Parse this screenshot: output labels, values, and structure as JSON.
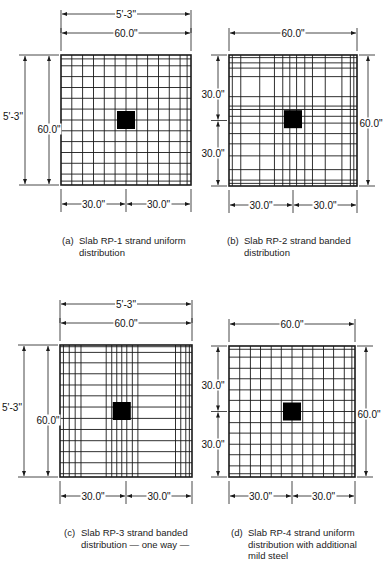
{
  "figure": {
    "panels": [
      {
        "id": "a",
        "caption_tag": "(a)",
        "caption": "Slab RP-1 strand uniform\ndistribution",
        "grid": {
          "x": 61,
          "y": 55,
          "w": 130,
          "h": 130
        },
        "verticals": [
          0.083,
          0.166,
          0.25,
          0.333,
          0.416,
          0.5,
          0.583,
          0.666,
          0.75,
          0.833,
          0.916,
          0.97
        ],
        "horizontals": [
          0.03,
          0.083,
          0.166,
          0.25,
          0.333,
          0.416,
          0.5,
          0.583,
          0.666,
          0.75,
          0.833,
          0.916,
          0.97
        ],
        "column": {
          "cx": 0.5,
          "cy": 0.5,
          "size": 18
        },
        "dims": {
          "top_outer": "5'-3\"",
          "top_inner": "60.0\"",
          "left_outer": "5'-3\"",
          "left_inner": "60.0\"",
          "bottom_left": "30.0\"",
          "bottom_right": "30.0\""
        }
      },
      {
        "id": "b",
        "caption_tag": "(b)",
        "caption": "Slab RP-2 strand banded\ndistribution",
        "grid": {
          "x": 229,
          "y": 55,
          "w": 128,
          "h": 131
        },
        "verticals": [
          0.026,
          0.092,
          0.24,
          0.355,
          0.42,
          0.475,
          0.528,
          0.592,
          0.652,
          0.752,
          0.882,
          0.948,
          0.975
        ],
        "horizontals": [
          0.02,
          0.06,
          0.1,
          0.165,
          0.318,
          0.39,
          0.416,
          0.468,
          0.52,
          0.6,
          0.678,
          0.77,
          0.875,
          0.955,
          0.98
        ],
        "column": {
          "cx": 0.5,
          "cy": 0.49,
          "size": 18
        },
        "dims": {
          "top_inner": "60.0\"",
          "left_top": "30.0\"",
          "left_bottom": "30.0\"",
          "right": "60.0\"",
          "bottom_left": "30.0\"",
          "bottom_right": "30.0\""
        }
      },
      {
        "id": "c",
        "caption_tag": "(c)",
        "caption": "Slab RP-3 strand banded\ndistribution — one way —",
        "grid": {
          "x": 60,
          "y": 345,
          "w": 132,
          "h": 132
        },
        "verticals": [
          0.026,
          0.07,
          0.115,
          0.159,
          0.35,
          0.392,
          0.43,
          0.468,
          0.506,
          0.548,
          0.59,
          0.875,
          0.915,
          0.953,
          0.98
        ],
        "horizontals": [
          0.013,
          0.056,
          0.135,
          0.218,
          0.303,
          0.385,
          0.47,
          0.556,
          0.64,
          0.725,
          0.808,
          0.892,
          0.975
        ],
        "column": {
          "cx": 0.468,
          "cy": 0.5,
          "size": 18
        },
        "dims": {
          "top_outer": "5'-3\"",
          "top_inner": "60.0\"",
          "left_outer": "5'-3\"",
          "left_inner": "60.0\"",
          "bottom_left": "30.0\"",
          "bottom_right": "30.0\""
        }
      },
      {
        "id": "d",
        "caption_tag": "(d)",
        "caption": "Slab RP-4 strand uniform\ndistribution with additional\nmild steel",
        "grid": {
          "x": 229,
          "y": 346,
          "w": 126,
          "h": 131
        },
        "verticals": [
          0.085,
          0.17,
          0.25,
          0.335,
          0.415,
          0.5,
          0.585,
          0.665,
          0.75,
          0.83,
          0.915,
          0.975
        ],
        "horizontals": [
          0.025,
          0.085,
          0.17,
          0.25,
          0.335,
          0.415,
          0.5,
          0.585,
          0.665,
          0.75,
          0.83,
          0.915,
          0.975
        ],
        "column": {
          "cx": 0.5,
          "cy": 0.5,
          "size": 18
        },
        "dims": {
          "top_inner": "60.0\"",
          "left_top": "30.0\"",
          "left_bottom": "30.0\"",
          "right": "60.0\"",
          "bottom_left": "30.0\"",
          "bottom_right": "30.0\""
        }
      }
    ]
  },
  "captions": {
    "a_tag": "(a)",
    "a_text": "Slab RP-1 strand uniform\ndistribution",
    "b_tag": "(b)",
    "b_text": "Slab RP-2 strand banded\ndistribution",
    "c_tag": "(c)",
    "c_text": "Slab RP-3 strand banded\ndistribution — one way —",
    "d_tag": "(d)",
    "d_text": "Slab RP-4 strand uniform\ndistribution with additional\nmild steel"
  }
}
